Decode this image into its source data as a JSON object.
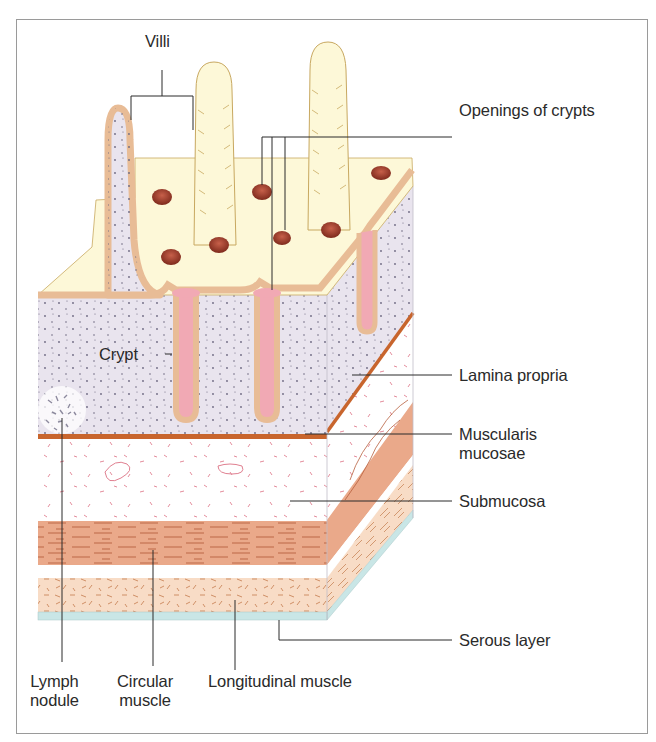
{
  "figure": {
    "colors": {
      "frame_border": "#9a9a9a",
      "villus_surface": "#fdf8d8",
      "villus_outline": "#c8a860",
      "epithelium": "#e8bc96",
      "lamina_propria": "#e9e4ee",
      "lamina_dots": "#6b6680",
      "crypt_lumen": "#f1a9b4",
      "crypt_opening": "#9b3a28",
      "muscularis_mucosae": "#c8652d",
      "submucosa": "#ffffff",
      "submucosa_fibers": "#e07f90",
      "circular_muscle": "#eaa98a",
      "circular_fibers": "#b8603e",
      "longitudinal_muscle": "#f8dcc6",
      "longitudinal_fibers": "#c9865a",
      "serous_layer": "#c9e6e6",
      "lymph_nodule": "#8d8a9e",
      "leader_line": "#2a2a2a"
    }
  },
  "labels": {
    "villi": "Villi",
    "openings_of_crypts": "Openings of crypts",
    "crypt": "Crypt",
    "lamina_propria": "Lamina propria",
    "muscularis_mucosae_line1": "Muscularis",
    "muscularis_mucosae_line2": "mucosae",
    "submucosa": "Submucosa",
    "serous_layer": "Serous layer",
    "lymph_nodule_line1": "Lymph",
    "lymph_nodule_line2": "nodule",
    "circular_muscle_line1": "Circular",
    "circular_muscle_line2": "muscle",
    "longitudinal_muscle": "Longitudinal muscle"
  }
}
